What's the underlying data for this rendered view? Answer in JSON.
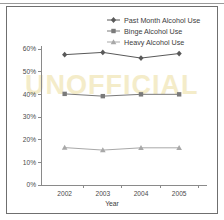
{
  "figure": {
    "watermark_text": "UNOFFICIAL"
  },
  "chart_data": {
    "type": "line",
    "title": "",
    "subtitle": "",
    "xlabel": "Year",
    "ylabel": "",
    "categories": [
      "2002",
      "2003",
      "2004",
      "2005"
    ],
    "x": [
      2002,
      2003,
      2004,
      2005
    ],
    "xlim": [
      2001.6,
      2005.6
    ],
    "ylim": [
      0,
      60
    ],
    "ytick_values": [
      0,
      10,
      20,
      30,
      40,
      50,
      60
    ],
    "ytick_labels": [
      "0%",
      "10%",
      "20%",
      "30%",
      "40%",
      "50%",
      "60%"
    ],
    "xtick_labels": [
      "2002",
      "2003",
      "2004",
      "2005"
    ],
    "grid": false,
    "legend_position": "top-right",
    "series": [
      {
        "name": "Past Month Alcohol Use",
        "marker": "diamond",
        "color": "#595959",
        "values": [
          57.5,
          58.5,
          56.0,
          58.0
        ]
      },
      {
        "name": "Binge Alcohol Use",
        "marker": "square",
        "color": "#7a7a7a",
        "values": [
          40.2,
          39.2,
          40.0,
          40.0
        ]
      },
      {
        "name": "Heavy Alcohol Use",
        "marker": "triangle",
        "color": "#a8a8a8",
        "values": [
          16.5,
          15.4,
          16.4,
          16.4
        ]
      }
    ]
  }
}
